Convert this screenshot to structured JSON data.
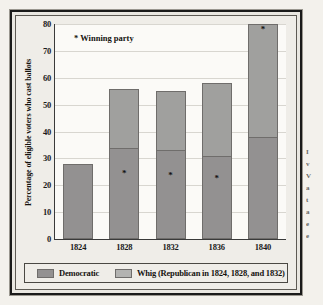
{
  "chart_data": {
    "type": "bar",
    "title": "",
    "subtitle": "",
    "xlabel": "",
    "ylabel": "Percentage of eligible voters who cast ballots",
    "ylim": [
      0,
      80
    ],
    "ytick_step": 10,
    "yticks": [
      "80",
      "70",
      "60",
      "50",
      "40",
      "30",
      "20",
      "10",
      "0"
    ],
    "grid": true,
    "stacked": true,
    "legend_position": "bottom",
    "categories": [
      "1824",
      "1828",
      "1832",
      "1836",
      "1840"
    ],
    "series": [
      {
        "name": "Democratic",
        "values": [
          28,
          34,
          33,
          31,
          38
        ]
      },
      {
        "name": "Whig (Republican in 1824, 1828, and 1832)",
        "values": [
          0,
          22,
          22,
          27,
          42
        ]
      }
    ],
    "totals": [
      28,
      56,
      55,
      58,
      80
    ],
    "annotations": {
      "winning_party_note": "* Winning party",
      "winner_marker": "*",
      "winners": [
        "",
        "Democratic",
        "Democratic",
        "Democratic",
        "Whig"
      ]
    }
  },
  "legend": {
    "items": [
      {
        "label": "Democratic",
        "color": "#939191"
      },
      {
        "label": "Whig (Republican in 1824, 1828, and 1832)",
        "color": "#b3b3b1"
      }
    ]
  },
  "side_column": {
    "lines": [
      "I",
      "v",
      "V",
      "a",
      "t",
      "a",
      "e",
      "e"
    ]
  }
}
